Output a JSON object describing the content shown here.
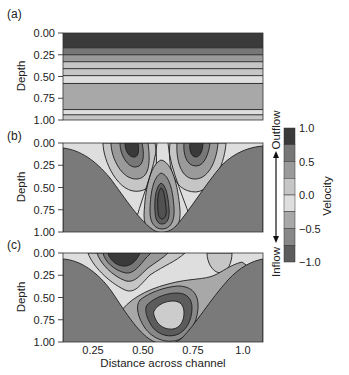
{
  "chart_data": {
    "type": "heatmap",
    "subtype": "filled-contour",
    "xlabel": "Distance across channel",
    "ylabel": "Depth",
    "x_ticks": [
      0.25,
      0.5,
      0.75,
      1.0
    ],
    "x_tick_labels": [
      "0.25",
      "0.50",
      "0.75",
      "1.0"
    ],
    "xlim": [
      0.1,
      1.1
    ],
    "y_ticks": [
      0.0,
      0.25,
      0.5,
      0.75,
      1.0
    ],
    "y_tick_labels": [
      "0.00",
      "0.25",
      "0.50",
      "0.75",
      "1.00"
    ],
    "ylim": [
      0.0,
      1.0
    ],
    "y_inverted": true,
    "panels": [
      {
        "label": "(a)",
        "description": "Horizontally uniform layered velocity",
        "layers": [
          {
            "depth_from": 0.0,
            "depth_to": 0.17,
            "velocity": 0.875
          },
          {
            "depth_from": 0.17,
            "depth_to": 0.25,
            "velocity": 0.625
          },
          {
            "depth_from": 0.25,
            "depth_to": 0.33,
            "velocity": 0.375
          },
          {
            "depth_from": 0.33,
            "depth_to": 0.41,
            "velocity": 0.125
          },
          {
            "depth_from": 0.41,
            "depth_to": 0.49,
            "velocity": 0.125
          },
          {
            "depth_from": 0.49,
            "depth_to": 0.58,
            "velocity": -0.125
          },
          {
            "depth_from": 0.58,
            "depth_to": 0.88,
            "velocity": -0.375
          },
          {
            "depth_from": 0.88,
            "depth_to": 0.94,
            "velocity": -0.125
          },
          {
            "depth_from": 0.94,
            "depth_to": 1.0,
            "velocity": 0.125
          }
        ]
      },
      {
        "label": "(b)",
        "description": "V-shaped channel; two surface outflow cores at ~0.42 and ~0.75, one deep core at ~0.58, depth ~0.6"
      },
      {
        "label": "(c)",
        "description": "V-shaped channel; strong surface core at ~0.38, weaker surface core at ~0.9, deep core at ~0.62, depth ~0.7"
      }
    ],
    "colorbar": {
      "label": "Velocity",
      "ticks": [
        1.0,
        0.5,
        0.0,
        -0.5,
        -1.0
      ],
      "tick_labels": [
        "1.0",
        "0.5",
        "0.0",
        "−0.5",
        "−1.0"
      ],
      "range": [
        -1.0,
        1.0
      ],
      "levels": [
        1.0,
        0.75,
        0.5,
        0.25,
        0.0,
        -0.25,
        -0.5,
        -0.75,
        -1.0
      ],
      "band_colors": [
        "#3a3a3a",
        "#777777",
        "#9a9a9a",
        "#c6c6c6",
        "#dedede",
        "#a8a8a8",
        "#888888",
        "#5c5c5c"
      ],
      "top_annotation": "Outflow",
      "bottom_annotation": "Inflow"
    },
    "bed_color": "#7a7a7a"
  }
}
